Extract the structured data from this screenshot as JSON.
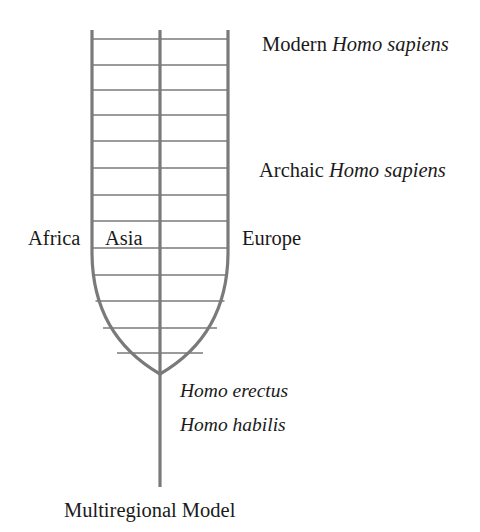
{
  "figure": {
    "title": "Multiregional Model",
    "type": "human-evolution-tree-diagram",
    "background_color": "#ffffff",
    "line_color": "#7a7a7a",
    "text_color": "#1a1a1a"
  },
  "caption": {
    "text": "Multiregional Model"
  },
  "labels": {
    "modern_sapiens": {
      "roman": "Modern",
      "italic": "Homo sapiens",
      "full": "Modern Homo sapiens"
    },
    "archaic_sapiens": {
      "roman": "Archaic",
      "italic": "Homo sapiens",
      "full": "Archaic Homo sapiens"
    },
    "homo_erectus": "Homo erectus",
    "homo_habilis": "Homo habilis"
  },
  "regions": [
    {
      "name": "Africa",
      "position": "left-outside"
    },
    {
      "name": "Asia",
      "position": "center-left-inside"
    },
    {
      "name": "Europe",
      "position": "right-outside"
    }
  ],
  "diagram_geometry": {
    "lineage_lines_x": [
      92,
      160,
      228
    ],
    "lineage_top_y": 30,
    "convergence_point": {
      "x": 160,
      "y": 374
    },
    "stem_bottom_y": 487,
    "gene_flow_rungs_y": [
      39,
      65,
      90,
      115,
      141,
      168,
      195,
      221,
      248,
      275,
      301,
      328,
      353
    ],
    "gene_flow_rung_count": 13,
    "curve_start_y": 252,
    "stroke_width_main": 3.2,
    "stroke_width_rung": 1.5
  }
}
